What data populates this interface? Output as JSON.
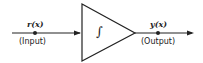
{
  "diagram": {
    "type": "block-diagram",
    "input": {
      "symbol": "r(x)",
      "caption": "(Input)"
    },
    "block": {
      "symbol": "∫",
      "shape": "triangle"
    },
    "output": {
      "symbol": "y(x)",
      "caption": "(Output)"
    },
    "colors": {
      "stroke": "#222222",
      "background": "#ffffff"
    }
  }
}
